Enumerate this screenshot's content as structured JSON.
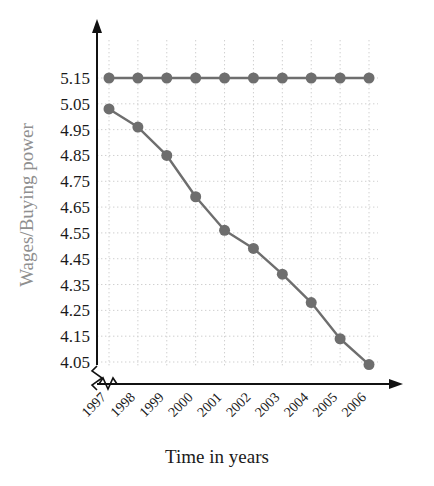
{
  "chart_data": {
    "type": "line",
    "title": "",
    "xlabel": "Time in years",
    "ylabel": "Wages/Buying power",
    "categories": [
      "1997",
      "1998",
      "1999",
      "2000",
      "2001",
      "2002",
      "2003",
      "2004",
      "2005",
      "2006"
    ],
    "x": [
      1997,
      1998,
      1999,
      2000,
      2001,
      2002,
      2003,
      2004,
      2005,
      2006
    ],
    "series": [
      {
        "name": "Wages",
        "values": [
          5.15,
          5.15,
          5.15,
          5.15,
          5.15,
          5.15,
          5.15,
          5.15,
          5.15,
          5.15
        ],
        "color": "#6e6e6e",
        "marker": "circle"
      },
      {
        "name": "Buying power",
        "values": [
          5.03,
          4.96,
          4.85,
          4.69,
          4.56,
          4.49,
          4.39,
          4.28,
          4.14,
          4.04
        ],
        "color": "#6e6e6e",
        "marker": "circle"
      }
    ],
    "yticks": [
      4.05,
      4.15,
      4.25,
      4.35,
      4.45,
      4.55,
      4.65,
      4.75,
      4.85,
      4.95,
      5.05,
      5.15
    ],
    "ytick_labels": [
      "4.05",
      "4.15",
      "4.25",
      "4.35",
      "4.45",
      "4.55",
      "4.65",
      "4.75",
      "4.85",
      "4.95",
      "5.05",
      "5.15"
    ],
    "ylim": [
      4.05,
      5.15
    ],
    "grid": true,
    "grid_style": "dotted",
    "grid_color": "#cfcfcf",
    "legend": "none",
    "axis_break_y": true,
    "axis_break_x": true,
    "axis_arrows": true,
    "axis_color": "#111111",
    "marker_radius": 5.5,
    "line_width": 2.4
  },
  "axes": {
    "x_title": "Time in years",
    "y_title": "Wages/Buying power"
  }
}
